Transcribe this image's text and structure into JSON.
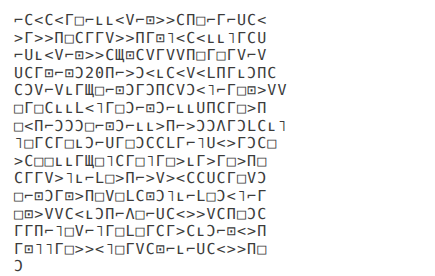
{
  "document": {
    "kind": "glyph-text-block",
    "background_color": "#ffffff",
    "text_color": "#3b3b3b",
    "line_count": 16,
    "lines": [
      "⌐Ϲ<Ϲ<Γ□⌐ʟʟ<V⌐⊡>>ϹΠ□⌐Γ⌐UϹ<",
      ">Γ>>Π□ϹΓΓV>>ΠΓ⊡˥<Ϲ<ʟʟ˥ΓϹU",
      "⌐Uʟ<V⌐⊡>>ϹЩ⊡ϹVΓVVΠ□Γ□ΓV⌐V",
      "UϹΓ⊡⌐⊡Ɔ20Π⌐>Ɔ<ʟϹ<V<LΠΓʟƆΠϹ",
      "ϹƆV⌐VʟΓЩ□⌐⊡ƆΓƆΠϹVƆ<˥⌐Γ□⊡>VV",
      "□Γ□ϹʟʟL<˥Γ□Ɔ⌐⊡Ɔ⌐ʟʟUΠϹΓ□>Π",
      "□<Π⌐ƆƆƆ□⌐⊡Ɔ⌐ʟʟ>Π⌐>ƆƆΛΓƆLϹʟ˥",
      "˥□ΓϹΓ□ʟƆ⌐UΓ□ƆϹϹLΓ⌐˥U<>ΓƆϹ□",
      ">Ϲ□□ʟʟΓЩ□˥ϹΓ□˥Γ□>ʟΓ>Γ□>Π□",
      "ϹΓΓV>˥ʟ⌐L□>Π⌐>V><ϹϹUϹΓ□VƆ",
      "□⌐⊡ƆΓ⊡>Π□V□LϹ⊡Ɔ˥ʟ⌐L□Ɔ<˥⌐Γ",
      "□⊡>VVϹ<ʟƆΠ⌐Λ□⌐UϹ<>>VϹΠ□ƆϹ",
      "ΓΓΠ⌐˥□V⌐˥Γ□L□ΓϹΓ>ϹʟƆ⌐⊡<>Π",
      "Γ⊡˥˥Γ□>><˥□ΓVϹ⊡⌐ʟ⌐UϹ<>>Π□",
      "Ɔ"
    ]
  }
}
